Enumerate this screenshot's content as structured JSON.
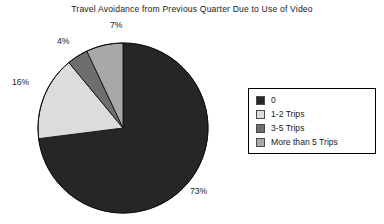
{
  "chart_data": {
    "type": "pie",
    "title": "Travel Avoidance from Previous Quarter Due to Use of Video",
    "xlabel": "",
    "ylabel": "",
    "legend_position": "right",
    "grid": false,
    "categories": [
      "0",
      "1-2 Trips",
      "3-5 Trips",
      "More than 5 Trips"
    ],
    "values": [
      73,
      16,
      4,
      7
    ],
    "value_labels": [
      "73%",
      "16%",
      "4%",
      "7%"
    ],
    "colors": [
      "#262626",
      "#dcdcdc",
      "#6e6e6e",
      "#a8a8a8"
    ],
    "slices": [
      {
        "label": "0",
        "value": 73,
        "value_label": "73%",
        "color": "#262626"
      },
      {
        "label": "1-2 Trips",
        "value": 16,
        "value_label": "16%",
        "color": "#dcdcdc"
      },
      {
        "label": "3-5 Trips",
        "value": 4,
        "value_label": "4%",
        "color": "#6e6e6e"
      },
      {
        "label": "More than 5 Trips",
        "value": 7,
        "value_label": "7%",
        "color": "#a8a8a8"
      }
    ],
    "start_angle_deg": 0,
    "direction": "clockwise",
    "units": "percent"
  },
  "legend": {
    "entries": [
      {
        "label": "0",
        "color": "#262626"
      },
      {
        "label": "1-2 Trips",
        "color": "#dcdcdc"
      },
      {
        "label": "3-5 Trips",
        "color": "#6e6e6e"
      },
      {
        "label": "More than 5 Trips",
        "color": "#a8a8a8"
      }
    ]
  }
}
